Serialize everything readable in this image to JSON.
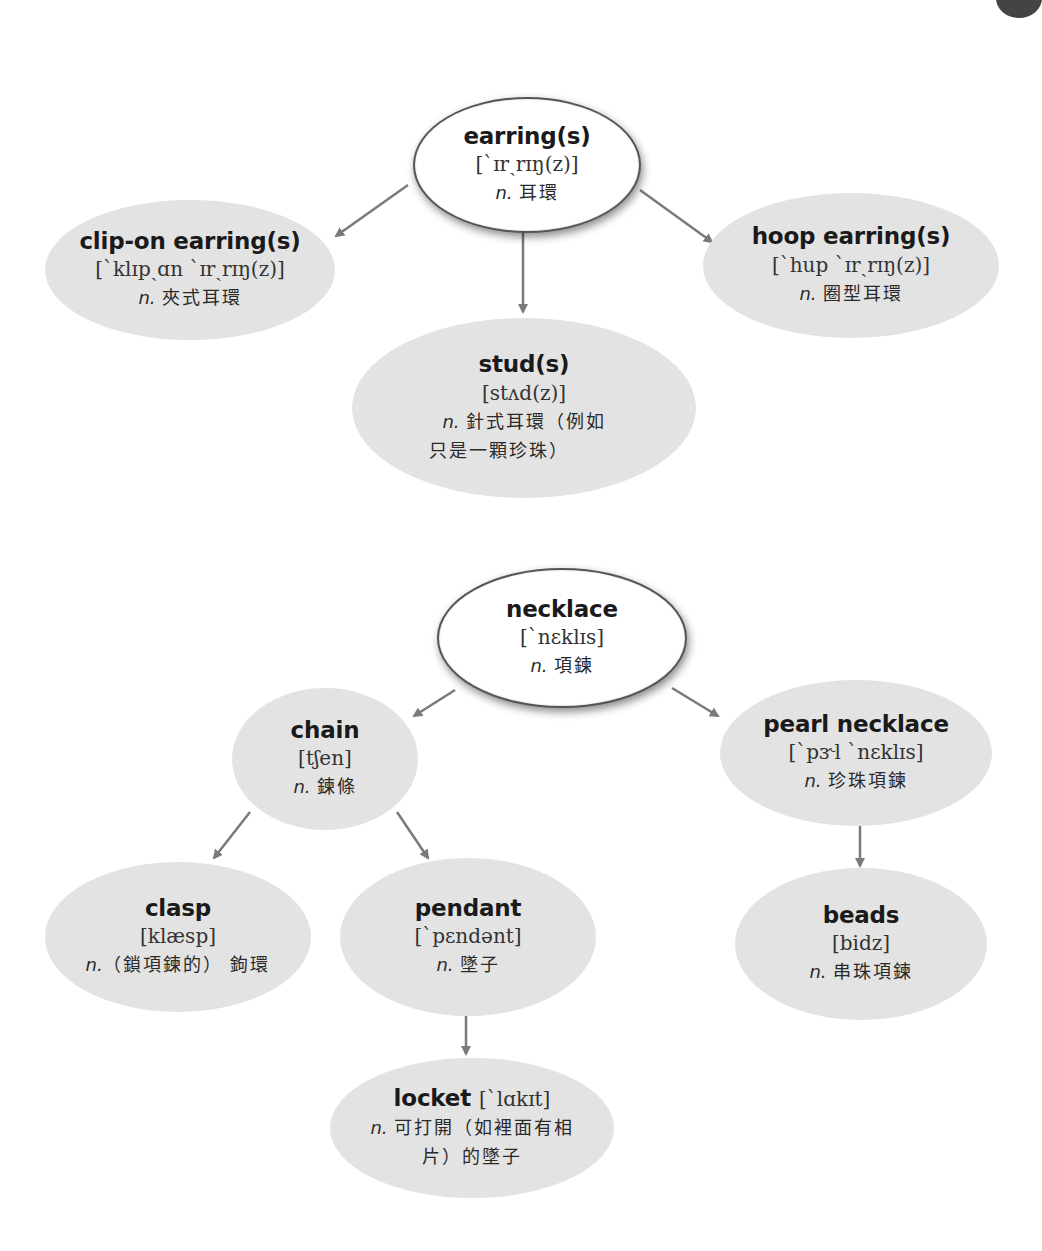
{
  "diagram": {
    "earrings_tree": {
      "root": {
        "term": "earring(s)",
        "phonetic": "[`ɪrˏrɪŋ(z)]",
        "pos": "n.",
        "definition": "耳環"
      },
      "children": [
        {
          "term": "clip-on earring(s)",
          "phonetic": "[`klɪpˏɑn `ɪrˏrɪŋ(z)]",
          "pos": "n.",
          "definition": "夾式耳環"
        },
        {
          "term": "stud(s)",
          "phonetic": "[stʌd(z)]",
          "pos": "n.",
          "definition_line1": "針式耳環（例如",
          "definition_line2": "只是一顆珍珠）"
        },
        {
          "term": "hoop earring(s)",
          "phonetic": "[`hup `ɪrˏrɪŋ(z)]",
          "pos": "n.",
          "definition": "圈型耳環"
        }
      ]
    },
    "necklace_tree": {
      "root": {
        "term": "necklace",
        "phonetic": "[`nɛklɪs]",
        "pos": "n.",
        "definition": "項鍊"
      },
      "chain": {
        "term": "chain",
        "phonetic": "[tʃen]",
        "pos": "n.",
        "definition": "鍊條"
      },
      "pearl_necklace": {
        "term": "pearl necklace",
        "phonetic": "[`pɝl `nɛklɪs]",
        "pos": "n.",
        "definition": "珍珠項鍊"
      },
      "clasp": {
        "term": "clasp",
        "phonetic": "[klæsp]",
        "pos": "n.",
        "definition": "（鎖項鍊的） 鉤環"
      },
      "pendant": {
        "term": "pendant",
        "phonetic": "[`pɛndənt]",
        "pos": "n.",
        "definition": "墜子"
      },
      "beads": {
        "term": "beads",
        "phonetic": "[bidz]",
        "pos": "n.",
        "definition": "串珠項鍊"
      },
      "locket": {
        "term": "locket",
        "phonetic": "[`lɑkɪt]",
        "pos": "n.",
        "definition_line1": "可打開（如裡面有相",
        "definition_line2": "片）的墜子"
      }
    },
    "colors": {
      "root_fill": "#ffffff",
      "child_fill": "#e3e3e3",
      "arrow": "#7a7a7a",
      "text": "#1a1a1a"
    }
  }
}
